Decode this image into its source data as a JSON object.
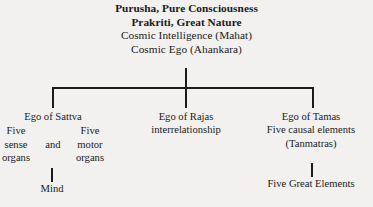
{
  "header": {
    "lines": [
      {
        "text": "Purusha, Pure Consciousness",
        "bold": true
      },
      {
        "text": "Prakriti, Great Nature",
        "bold": true
      },
      {
        "text": "Cosmic Intelligence (Mahat)",
        "bold": false
      },
      {
        "text": "Cosmic Ego (Ahankara)",
        "bold": false
      }
    ]
  },
  "branches": {
    "left": {
      "title": "Ego of Sattva",
      "sub_a": {
        "line1": "Five",
        "line2": "sense",
        "line3": "organs"
      },
      "joiner": "and",
      "sub_b": {
        "line1": "Five",
        "line2": "motor",
        "line3": "organs"
      },
      "leaf": "Mind"
    },
    "middle": {
      "title": "Ego of Rajas",
      "line2": "interrelationship"
    },
    "right": {
      "title": "Ego of Tamas",
      "line2": "Five causal elements",
      "line3": "(Tanmatras)",
      "leaf": "Five Great Elements"
    }
  },
  "style": {
    "background_color": "#f2f1ef",
    "text_color": "#1b1b1b",
    "rule_color": "#1b1b1b"
  }
}
